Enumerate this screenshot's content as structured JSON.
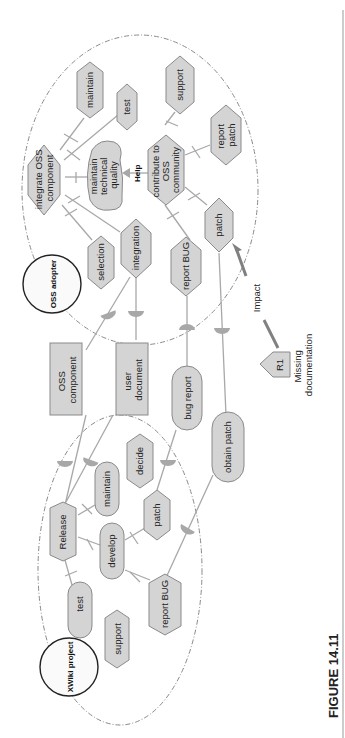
{
  "figure": {
    "caption": "FIGURE 14.11",
    "orientation": "rotated-90-ccw"
  },
  "actors": {
    "oss_adopter": {
      "label": "OSS adopter"
    },
    "xwiki_project": {
      "label": "XWiki project"
    }
  },
  "oss_adopter_nodes": {
    "integrate_oss_component": {
      "line1": "integrate OSS",
      "line2": "component",
      "type": "task"
    },
    "maintain": {
      "label": "maintain",
      "type": "task"
    },
    "test": {
      "label": "test",
      "type": "task"
    },
    "maintain_technical_quality": {
      "line1": "maintain",
      "line2": "technical",
      "line3": "quality",
      "type": "softgoal"
    },
    "help_label": "Help",
    "contribute_to_oss_community": {
      "line1": "contribute to",
      "line2": "OSS",
      "line3": "community",
      "type": "task"
    },
    "support": {
      "label": "support",
      "type": "task"
    },
    "report_patch": {
      "line1": "report",
      "line2": "patch",
      "type": "task"
    },
    "patch": {
      "label": "patch",
      "type": "task"
    },
    "selection": {
      "label": "selection",
      "type": "task"
    },
    "integration": {
      "label": "integration",
      "type": "task"
    },
    "report_bug": {
      "label": "report BUG",
      "type": "task"
    }
  },
  "dependums": {
    "oss_component": {
      "line1": "OSS",
      "line2": "component",
      "type": "resource"
    },
    "user_document": {
      "line1": "user",
      "line2": "document",
      "type": "resource"
    },
    "bug_report": {
      "label": "bug report",
      "type": "goal"
    },
    "obtain_patch": {
      "label": "obtain patch",
      "type": "goal"
    }
  },
  "xwiki_nodes": {
    "release": {
      "label": "Release",
      "type": "task"
    },
    "maintain": {
      "label": "maintain",
      "type": "goal"
    },
    "decide": {
      "label": "decide",
      "type": "task"
    },
    "patch": {
      "label": "patch",
      "type": "task"
    },
    "develop": {
      "label": "develop",
      "type": "goal"
    },
    "test": {
      "label": "test",
      "type": "goal"
    },
    "support": {
      "label": "support",
      "type": "task"
    },
    "report_bug": {
      "label": "report BUG",
      "type": "task"
    }
  },
  "risk": {
    "id": "R1",
    "line1": "Missing",
    "line2": "documentation",
    "impact_label": "Impact"
  },
  "colors": {
    "node_fill": "#d4d4d4",
    "node_stroke": "#8a8a8a",
    "link": "#a8a8a8",
    "actor_stroke": "#222222",
    "impact_arrow": "#808080"
  }
}
